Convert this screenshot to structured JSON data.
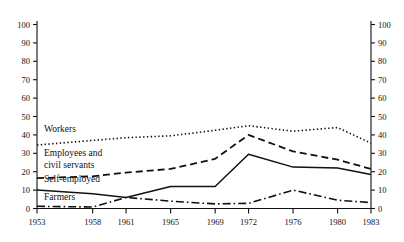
{
  "chart_data": {
    "type": "line",
    "title": "",
    "subtitle": "",
    "xlabel": "",
    "ylabel": "",
    "x": [
      1953,
      1958,
      1961,
      1965,
      1969,
      1972,
      1976,
      1980,
      1983
    ],
    "xtick_labels": [
      "1953",
      "1958",
      "1961",
      "1965",
      "1969",
      "1972",
      "1976",
      "1980",
      "1983"
    ],
    "ytick_labels": [
      "0",
      "10",
      "20",
      "30",
      "40",
      "50",
      "60",
      "70",
      "80",
      "90",
      "100"
    ],
    "ylim": [
      0,
      100
    ],
    "ytick_step": 10,
    "grid": false,
    "legend_position": "inline-left",
    "dual_y_axis": true,
    "series": [
      {
        "name": "Workers",
        "label": "Workers",
        "line_style": "dotted",
        "color": "#111111",
        "values": [
          34.5,
          37.0,
          38.5,
          39.5,
          42.5,
          45.0,
          42.0,
          44.0,
          35.5
        ]
      },
      {
        "name": "Employees and civil servants",
        "label": "Employees and\ncivil servants",
        "label_line1": "Employees and",
        "label_line2": "civil servants",
        "line_style": "dashed",
        "color": "#111111",
        "values": [
          16.5,
          17.5,
          19.5,
          21.5,
          27.0,
          40.0,
          31.0,
          26.5,
          21.5
        ]
      },
      {
        "name": "Self-employed",
        "label": "Self-employed",
        "line_style": "solid",
        "color": "#111111",
        "values": [
          10.0,
          8.0,
          6.0,
          12.0,
          12.0,
          29.5,
          22.5,
          22.0,
          18.5
        ]
      },
      {
        "name": "Farmers",
        "label": "Farmers",
        "line_style": "dash-dot",
        "color": "#111111",
        "values": [
          1.2,
          0.8,
          6.0,
          4.0,
          2.5,
          2.8,
          10.0,
          4.5,
          3.2
        ]
      }
    ]
  },
  "axes": {
    "left_axis_name": "left-value-axis",
    "right_axis_name": "right-value-axis",
    "bottom_axis_name": "year-axis"
  }
}
